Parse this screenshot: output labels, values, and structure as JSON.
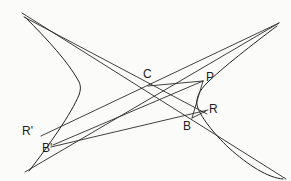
{
  "figure": {
    "type": "geometry-diagram",
    "background_color": "#fbfbf9",
    "stroke_color": "#2b2b2b",
    "width": 291,
    "height": 181,
    "labels": [
      {
        "id": "C",
        "text": "C",
        "x": 143,
        "y": 68,
        "point_x": 148,
        "point_y": 86
      },
      {
        "id": "P",
        "text": "P",
        "x": 207,
        "y": 72,
        "point_x": 203,
        "point_y": 81
      },
      {
        "id": "R",
        "text": "R",
        "x": 209,
        "y": 104,
        "point_x": 203,
        "point_y": 112
      },
      {
        "id": "B",
        "text": "B",
        "x": 184,
        "y": 120,
        "point_x": 193,
        "point_y": 117
      },
      {
        "id": "Rp",
        "text": "R'",
        "x": 23,
        "y": 126,
        "point_x": 43,
        "point_y": 134
      },
      {
        "id": "Bp",
        "text": "B'",
        "x": 42,
        "y": 142,
        "point_x": 53,
        "point_y": 145
      }
    ],
    "asymptotes": [
      {
        "id": "asymptote-upper-left-to-lower-right",
        "x1": 22,
        "y1": 13,
        "x2": 286,
        "y2": 179
      },
      {
        "id": "asymptote-lower-left-to-upper-right",
        "x1": 25,
        "y1": 172,
        "x2": 279,
        "y2": 23
      }
    ],
    "curves": [
      {
        "id": "hyperbola-left-branch",
        "vertex_x": 80,
        "vertex_y": 86
      },
      {
        "id": "hyperbola-right-branch",
        "vertex_x": 198,
        "vertex_y": 103
      }
    ],
    "chords": [
      {
        "id": "chord-topleft-through-C-to-R",
        "x1": 24,
        "y1": 17,
        "x2": 206,
        "y2": 114
      },
      {
        "id": "chord-Rprime-to-topright",
        "x1": 43,
        "y1": 134,
        "x2": 279,
        "y2": 23
      },
      {
        "id": "chord-Bprime-to-P",
        "x1": 53,
        "y1": 145,
        "x2": 203,
        "y2": 81
      },
      {
        "id": "chord-Bprime-to-R",
        "x1": 52,
        "y1": 147,
        "x2": 207,
        "y2": 110
      },
      {
        "id": "segment-C-to-P",
        "x1": 148,
        "y1": 86,
        "x2": 203,
        "y2": 81
      },
      {
        "id": "segment-B-to-R",
        "x1": 193,
        "y1": 117,
        "x2": 205,
        "y2": 112
      },
      {
        "id": "segment-P-to-B",
        "x1": 203,
        "y1": 81,
        "x2": 193,
        "y2": 117
      }
    ]
  }
}
